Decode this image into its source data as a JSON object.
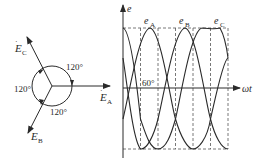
{
  "phasor": {
    "vectors": [
      {
        "id": "A",
        "label_main": "E",
        "label_sub": "A",
        "angle_deg": 0
      },
      {
        "id": "B",
        "label_main": "E",
        "label_sub": "B",
        "angle_deg": -120
      },
      {
        "id": "C",
        "label_main": "E",
        "label_sub": "C",
        "angle_deg": 120
      }
    ],
    "angle_labels": [
      "120°",
      "120°",
      "120°"
    ]
  },
  "waveform": {
    "y_axis_label": "e",
    "x_axis_label": "ωt",
    "curves": [
      {
        "label_main": "e",
        "label_sub": "A"
      },
      {
        "label_main": "e",
        "label_sub": "B"
      },
      {
        "label_main": "e",
        "label_sub": "C"
      }
    ],
    "phase_label": "60°"
  },
  "colors": {
    "line": "#2a2a2a",
    "dash": "#555555",
    "background": "#ffffff"
  }
}
